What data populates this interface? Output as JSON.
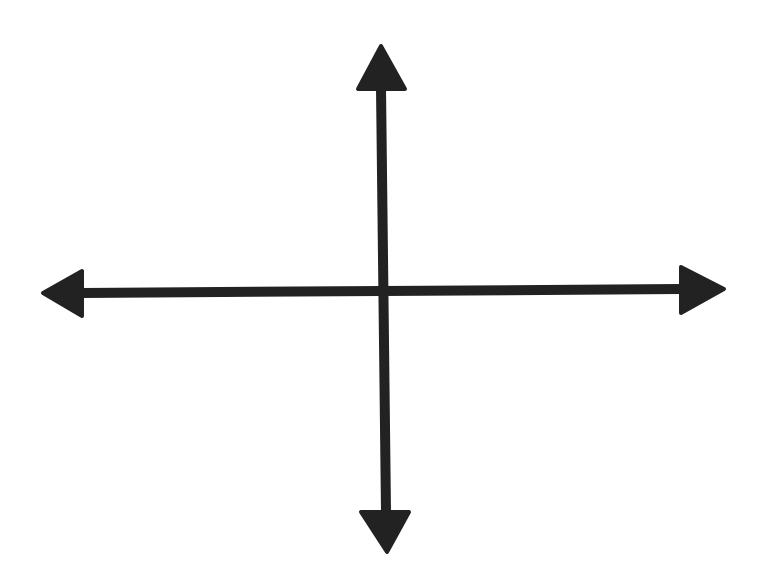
{
  "diagram": {
    "type": "coordinate-axes",
    "background": "#ffffff",
    "stroke_color": "#222222",
    "stroke_width": 10,
    "horizontal_axis": {
      "from": [
        82,
        293
      ],
      "to": [
        681,
        289
      ],
      "left_arrowhead": {
        "tip": [
          43,
          293
        ],
        "base_top": [
          82,
          271
        ],
        "base_bottom": [
          82,
          316
        ]
      },
      "right_arrowhead": {
        "tip": [
          724,
          289
        ],
        "base_top": [
          681,
          267
        ],
        "base_bottom": [
          681,
          313
        ]
      }
    },
    "vertical_axis": {
      "from": [
        381,
        88
      ],
      "to": [
        386,
        512
      ],
      "top_arrowhead": {
        "tip": [
          381,
          46
        ],
        "base_left": [
          358,
          89
        ],
        "base_right": [
          405,
          89
        ]
      },
      "bottom_arrowhead": {
        "tip": [
          387,
          552
        ],
        "base_left": [
          361,
          512
        ],
        "base_right": [
          409,
          512
        ]
      }
    }
  }
}
